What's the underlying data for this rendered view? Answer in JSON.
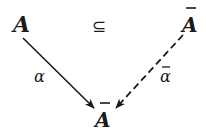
{
  "diagram": {
    "nodes": {
      "top_left": {
        "label": "A",
        "bar": false
      },
      "top_right": {
        "label": "A",
        "bar": true
      },
      "bottom": {
        "label": "A",
        "bar": true
      }
    },
    "relation": {
      "symbol": "⊆"
    },
    "edges": {
      "left": {
        "label": "α",
        "bar": false,
        "style": "solid",
        "from": "top_left",
        "to": "bottom"
      },
      "right": {
        "label": "α",
        "bar": true,
        "style": "dashed",
        "from": "top_right",
        "to": "bottom"
      }
    },
    "colors": {
      "ink": "#1a1a1a",
      "background": "#ffffff"
    }
  }
}
